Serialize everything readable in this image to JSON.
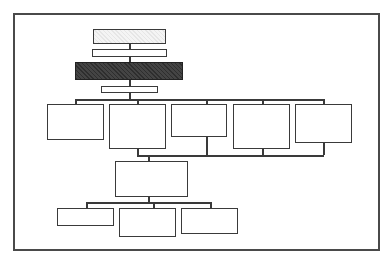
{
  "diagram": {
    "type": "org-chart",
    "text_visible": false,
    "colors": {
      "frame": "#4a4a4a",
      "line": "#3a3a3a",
      "dark_box": "#333333",
      "light_box": "#eeeeee",
      "background": "#ffffff"
    },
    "nodes": [
      {
        "id": "top-box",
        "label": "",
        "fill": "light"
      },
      {
        "id": "second-box",
        "label": "",
        "fill": "white"
      },
      {
        "id": "highlighted-box",
        "label": "",
        "fill": "dark"
      },
      {
        "id": "fourth-box",
        "label": "",
        "fill": "white"
      },
      {
        "id": "row-box-1",
        "label": "",
        "fill": "white"
      },
      {
        "id": "row-box-2",
        "label": "",
        "fill": "white"
      },
      {
        "id": "row-box-3",
        "label": "",
        "fill": "white"
      },
      {
        "id": "row-box-4",
        "label": "",
        "fill": "white"
      },
      {
        "id": "row-box-5",
        "label": "",
        "fill": "white"
      },
      {
        "id": "middle-box",
        "label": "",
        "fill": "white"
      },
      {
        "id": "bottom-box-1",
        "label": "",
        "fill": "white"
      },
      {
        "id": "bottom-box-2",
        "label": "",
        "fill": "white"
      },
      {
        "id": "bottom-box-3",
        "label": "",
        "fill": "white"
      }
    ]
  }
}
